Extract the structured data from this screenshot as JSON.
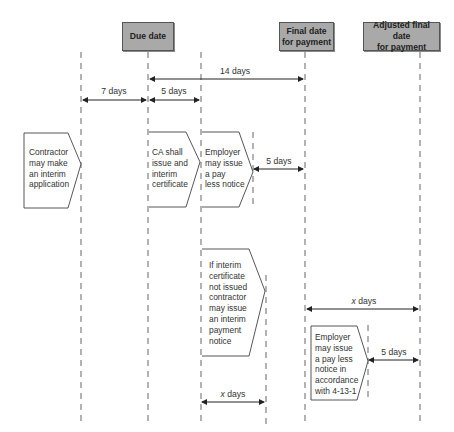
{
  "headers": {
    "due_date": "Due date",
    "final_date_line1": "Final date",
    "final_date_line2": "for payment",
    "adjusted_line1": "Adjusted final date",
    "adjusted_line2": "for payment"
  },
  "dimensions": {
    "fourteen_days": "14 days",
    "seven_days": "7 days",
    "five_days_top": "5 days",
    "five_days_employer": "5 days",
    "x_days_right": "days",
    "x_days_right_var": "x",
    "five_days_bottom": "5 days",
    "x_days_bottom": "days",
    "x_days_bottom_var": "x"
  },
  "boxes": {
    "contractor": [
      "Contractor",
      "may make",
      "an interim",
      "application"
    ],
    "ca": [
      "CA shall",
      "issue and",
      "interim",
      "certificate"
    ],
    "employer": [
      "Employer",
      "may issue",
      "a pay",
      "less notice"
    ],
    "interim_notice": [
      "If interim",
      "certificate",
      "not issued",
      "contractor",
      "may issue",
      "an interim",
      "payment",
      "notice"
    ],
    "employer_payless": [
      "Employer",
      "may issue",
      "a pay less",
      "notice in",
      "accordance",
      "with 4-13-1"
    ]
  },
  "colors": {
    "header_fill": "#a9a9a9",
    "line": "#333333"
  }
}
